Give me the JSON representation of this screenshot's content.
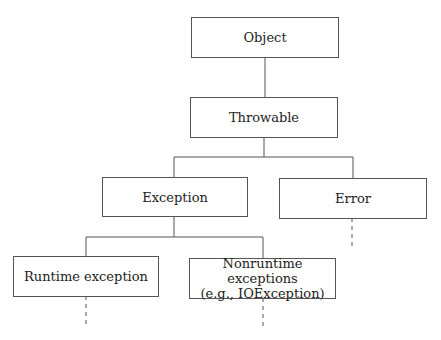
{
  "diagram": {
    "type": "class-hierarchy-tree",
    "nodes": {
      "object": {
        "label": "Object"
      },
      "throwable": {
        "label": "Throwable"
      },
      "exception": {
        "label": "Exception"
      },
      "error": {
        "label": "Error"
      },
      "runtime": {
        "label": "Runtime exception"
      },
      "nonruntime": {
        "line1": "Nonruntime exceptions",
        "line2": "(e.g., IOException)"
      }
    },
    "edges": [
      {
        "from": "Object",
        "to": "Throwable",
        "style": "solid"
      },
      {
        "from": "Throwable",
        "to": "Exception",
        "style": "solid"
      },
      {
        "from": "Throwable",
        "to": "Error",
        "style": "solid"
      },
      {
        "from": "Exception",
        "to": "Runtime exception",
        "style": "solid"
      },
      {
        "from": "Exception",
        "to": "Nonruntime exceptions (e.g., IOException)",
        "style": "solid"
      },
      {
        "from": "Error",
        "to": "...",
        "style": "dashed"
      },
      {
        "from": "Runtime exception",
        "to": "...",
        "style": "dashed"
      },
      {
        "from": "Nonruntime exceptions (e.g., IOException)",
        "to": "...",
        "style": "dashed"
      }
    ],
    "colors": {
      "line": "#555555",
      "text": "#222222",
      "background": "#ffffff"
    }
  }
}
